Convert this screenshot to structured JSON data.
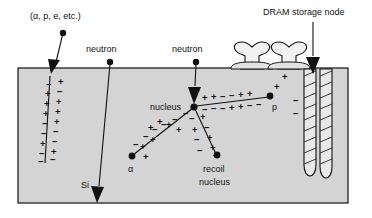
{
  "figure": {
    "title_visible": false,
    "substrate_label": "Si",
    "colors": {
      "substrate_fill": "#d4d4d4",
      "outline": "#111111",
      "page_background": "#ffffff",
      "trench_fill": "#e8e8e8"
    }
  },
  "labels": {
    "particle_source": "(α, p, e, etc.)",
    "neutron_left": "neutron",
    "neutron_right": "neutron",
    "dram": "DRAM storage node",
    "nucleus": "nucleus",
    "alpha": "α",
    "proton": "p",
    "recoil_line1": "recoil",
    "recoil_line2": "nucleus",
    "silicon": "Si"
  },
  "charge_symbols": {
    "plus": "+",
    "minus": "−"
  },
  "tracks": [
    {
      "name": "primary-ionizing-particle-track",
      "source_label": "(α, p, e, etc.)",
      "has_arrowhead": true,
      "charges": "alternating plus and minus pairs along track"
    },
    {
      "name": "neutron-left-track",
      "source_label": "neutron",
      "has_arrowhead": true,
      "charges": "none"
    },
    {
      "name": "neutron-right-track",
      "source_label": "neutron",
      "has_arrowhead": true,
      "charges": "none"
    },
    {
      "name": "alpha-track",
      "endpoint_label": "α",
      "has_arrowhead": false,
      "charges": "plus below, minus above"
    },
    {
      "name": "proton-track",
      "endpoint_label": "p",
      "has_arrowhead": false,
      "charges": "plus above, minus below"
    },
    {
      "name": "recoil-nucleus-track",
      "endpoint_label": "recoil nucleus",
      "has_arrowhead": false,
      "charges": "plus right, minus left"
    },
    {
      "name": "dram-pointer",
      "source_label": "DRAM storage node",
      "has_arrowhead": true,
      "charges": "none"
    }
  ],
  "structures": {
    "gates": 2,
    "trench_capacitors": 2,
    "trench_hatching": true
  }
}
